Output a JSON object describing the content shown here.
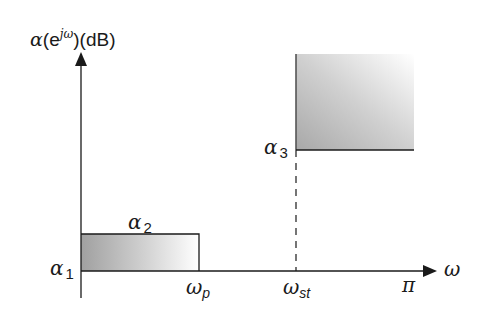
{
  "diagram": {
    "type": "filter-specification",
    "y_axis_label": {
      "prefix": "α",
      "open": "(e",
      "superscript": "jω",
      "close": ")",
      "unit": "(dB)"
    },
    "x_axis_label": "ω",
    "labels": {
      "alpha1": {
        "symbol": "α",
        "sub": "1"
      },
      "alpha2": {
        "symbol": "α",
        "sub": "2"
      },
      "alpha3": {
        "symbol": "α",
        "sub": "3"
      },
      "omega_p": {
        "symbol": "ω",
        "sub": "p"
      },
      "omega_st": {
        "symbol": "ω",
        "sub": "st"
      },
      "pi": "π"
    },
    "regions": [
      {
        "name": "passband",
        "x_from": "0",
        "x_to": "ω_p",
        "y_from": "α_1",
        "y_to": "α_2",
        "fill": "gradient-gray"
      },
      {
        "name": "stopband",
        "x_from": "ω_st",
        "x_to": "π",
        "y_from": "α_3",
        "y_to": "∞",
        "fill": "gradient-gray"
      }
    ],
    "colors": {
      "axis": "#1a1a1a",
      "shade_dark": "#9a9a9a",
      "shade_light": "#ffffff"
    }
  }
}
